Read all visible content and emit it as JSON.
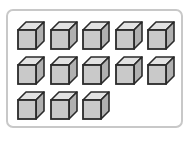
{
  "figure": {
    "total_cubes": 13,
    "rows": [
      {
        "count": 5
      },
      {
        "count": 5
      },
      {
        "count": 3
      }
    ],
    "colors": {
      "frame_border": "#c8c8c8",
      "cube_front": "#c9c9c9",
      "cube_top": "#e2e2e2",
      "cube_side": "#b0b0b0",
      "cube_edge": "#2a2a2a"
    }
  }
}
